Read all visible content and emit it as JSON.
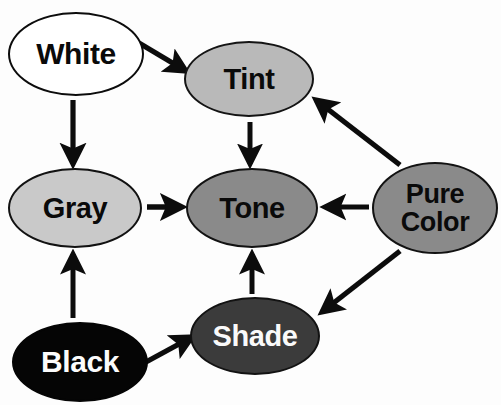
{
  "diagram": {
    "type": "directed-graph",
    "background_color": "#fdfdfd",
    "edge_color": "#0c0c0c",
    "nodes": [
      {
        "id": "white",
        "label": "White",
        "fill": "#ffffff",
        "text_color": "#0a0a0a",
        "border_color": "#0c0c0c",
        "cx": 76,
        "cy": 54,
        "rx": 68,
        "ry": 42
      },
      {
        "id": "tint",
        "label": "Tint",
        "fill": "#b9b9b9",
        "text_color": "#0a0a0a",
        "border_color": "#141414",
        "cx": 249,
        "cy": 79,
        "rx": 65,
        "ry": 38
      },
      {
        "id": "gray",
        "label": "Gray",
        "fill": "#c9c9c9",
        "text_color": "#0a0a0a",
        "border_color": "#121212",
        "cx": 75,
        "cy": 208,
        "rx": 67,
        "ry": 40
      },
      {
        "id": "tone",
        "label": "Tone",
        "fill": "#8a8a8a",
        "text_color": "#0a0a0a",
        "border_color": "#121212",
        "cx": 252,
        "cy": 208,
        "rx": 66,
        "ry": 40
      },
      {
        "id": "pure-color",
        "label": "Pure\nColor",
        "fill": "#8a8a8a",
        "text_color": "#0a0a0a",
        "border_color": "#121212",
        "cx": 435,
        "cy": 208,
        "rx": 63,
        "ry": 46
      },
      {
        "id": "shade",
        "label": "Shade",
        "fill": "#3b3b3b",
        "text_color": "#fafafa",
        "border_color": "#121212",
        "cx": 255,
        "cy": 336,
        "rx": 65,
        "ry": 39
      },
      {
        "id": "black",
        "label": "Black",
        "fill": "#050505",
        "text_color": "#fcfcfc",
        "border_color": "#050505",
        "cx": 80,
        "cy": 362,
        "rx": 68,
        "ry": 40
      }
    ],
    "edges": [
      {
        "id": "white-to-tint",
        "from": "White",
        "to": "Tint",
        "direction": "diagonal-down-right"
      },
      {
        "id": "white-to-gray",
        "from": "White",
        "to": "Gray",
        "direction": "down"
      },
      {
        "id": "tint-to-tone",
        "from": "Tint",
        "to": "Tone",
        "direction": "down"
      },
      {
        "id": "gray-to-tone",
        "from": "Gray",
        "to": "Tone",
        "direction": "right"
      },
      {
        "id": "black-to-gray",
        "from": "Black",
        "to": "Gray",
        "direction": "up"
      },
      {
        "id": "black-to-shade",
        "from": "Black",
        "to": "Shade",
        "direction": "diagonal-up-right"
      },
      {
        "id": "shade-to-tone",
        "from": "Shade",
        "to": "Tone",
        "direction": "up"
      },
      {
        "id": "purecolor-to-tone",
        "from": "Pure Color",
        "to": "Tone",
        "direction": "left"
      },
      {
        "id": "purecolor-to-tint",
        "from": "Pure Color",
        "to": "Tint",
        "direction": "diagonal-up-left"
      },
      {
        "id": "purecolor-to-shade",
        "from": "Pure Color",
        "to": "Shade",
        "direction": "diagonal-down-left"
      }
    ]
  }
}
